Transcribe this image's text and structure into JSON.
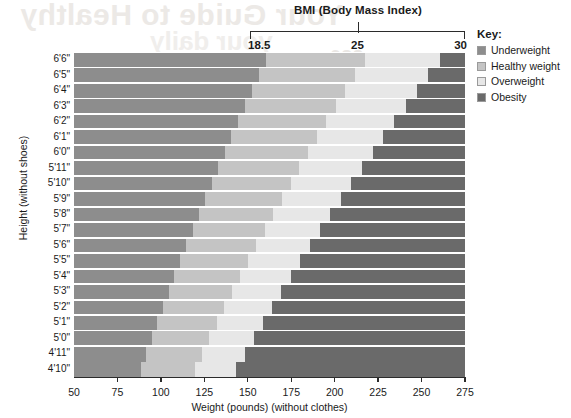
{
  "chart_data": {
    "type": "area",
    "title": "BMI (Body Mass Index)",
    "xlabel": "Weight (pounds) (without clothes)",
    "ylabel": "Height (without shoes)",
    "xlim": [
      50,
      275
    ],
    "ylim_categories_bottom_to_top": [
      "4'10\"",
      "4'11\"",
      "5'0\"",
      "5'1\"",
      "5'2\"",
      "5'3\"",
      "5'4\"",
      "5'5\"",
      "5'6\"",
      "5'7\"",
      "5'8\"",
      "5'9\"",
      "5'10\"",
      "5'11\"",
      "6'0\"",
      "6'1\"",
      "6'2\"",
      "6'3\"",
      "6'4\"",
      "6'5\"",
      "6'6\""
    ],
    "grid": true,
    "legend_position": "right",
    "x_tick_labels": [
      "50",
      "75",
      "100",
      "125",
      "150",
      "175",
      "200",
      "225",
      "250",
      "275"
    ],
    "x_tick_values": [
      50,
      75,
      100,
      125,
      150,
      175,
      200,
      225,
      250,
      275
    ],
    "secondary_axis": {
      "title": "BMI (Body Mass Index)",
      "tick_labels": [
        "18.5",
        "25",
        "30"
      ],
      "tick_values": [
        18.5,
        25,
        30
      ],
      "position": "top",
      "note": "Ticks are positioned at the weights corresponding to each BMI at the topmost height (6'6\")"
    },
    "categories": [
      "Underweight",
      "Healthy weight",
      "Overweight",
      "Obesity"
    ],
    "band_boundaries_bmi": [
      18.5,
      25,
      30
    ],
    "series": [
      {
        "name": "Underweight",
        "color": "#8d8d8d",
        "boundary_weights_lb_bottom_to_top": [
          88.4,
          91.5,
          94.6,
          97.8,
          101.1,
          104.4,
          107.8,
          111.2,
          114.7,
          118.2,
          121.8,
          125.5,
          129.2,
          132.9,
          136.7,
          140.6,
          144.5,
          148.5,
          152.5,
          156.6,
          160.7
        ]
      },
      {
        "name": "Healthy weight",
        "color": "#c4c4c4",
        "boundary_weights_lb_bottom_to_top": [
          119.5,
          123.6,
          127.9,
          132.2,
          136.6,
          141.1,
          145.6,
          150.3,
          155.0,
          159.8,
          164.6,
          169.6,
          174.6,
          179.6,
          184.8,
          190.0,
          195.3,
          200.7,
          206.1,
          211.6,
          217.2
        ]
      },
      {
        "name": "Overweight",
        "color": "#e7e7e7",
        "boundary_weights_lb_bottom_to_top": [
          143.4,
          148.4,
          153.4,
          158.6,
          163.9,
          169.3,
          174.8,
          180.3,
          186.0,
          191.7,
          197.6,
          203.5,
          209.5,
          215.6,
          221.8,
          228.0,
          234.4,
          240.8,
          247.3,
          253.9,
          260.6
        ]
      },
      {
        "name": "Obesity",
        "color": "#6a6a6a",
        "boundary_weights_lb_bottom_to_top": [
          275,
          275,
          275,
          275,
          275,
          275,
          275,
          275,
          275,
          275,
          275,
          275,
          275,
          275,
          275,
          275,
          275,
          275,
          275,
          275,
          275
        ]
      }
    ]
  },
  "axes": {
    "x": {
      "title": "Weight (pounds) (without clothes)",
      "ticks": [
        "50",
        "75",
        "100",
        "125",
        "150",
        "175",
        "200",
        "225",
        "250",
        "275"
      ]
    },
    "y": {
      "title": "Height (without shoes)",
      "ticks_top_to_bottom": [
        "6'6\"",
        "6'5\"",
        "6'4\"",
        "6'3\"",
        "6'2\"",
        "6'1\"",
        "6'0\"",
        "5'11\"",
        "5'10\"",
        "5'9\"",
        "5'8\"",
        "5'7\"",
        "5'6\"",
        "5'5\"",
        "5'4\"",
        "5'3\"",
        "5'2\"",
        "5'1\"",
        "5'0\"",
        "4'11\"",
        "4'10\""
      ]
    },
    "bmi": {
      "title": "BMI (Body Mass Index)",
      "ticks": [
        "18.5",
        "25",
        "30"
      ]
    }
  },
  "key": {
    "title": "Key:",
    "items": [
      {
        "label": "Underweight",
        "color": "#8d8d8d"
      },
      {
        "label": "Healthy weight",
        "color": "#c4c4c4"
      },
      {
        "label": "Overweight",
        "color": "#e7e7e7"
      },
      {
        "label": "Obesity",
        "color": "#6a6a6a"
      }
    ]
  },
  "artifacts": {
    "bleed_text_1": "Your Guide to Healthy",
    "bleed_text_2": "your daily",
    "bleed_text_3": "m 226"
  }
}
